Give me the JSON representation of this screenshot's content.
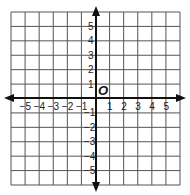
{
  "diagram": {
    "type": "coordinate-plane",
    "origin_label": "O",
    "x_range": [
      -6,
      6
    ],
    "y_range": [
      -6,
      6
    ],
    "x_tick_labels": [
      "−5",
      "−4",
      "−3",
      "−2",
      "−1",
      "1",
      "2",
      "3",
      "4",
      "5"
    ],
    "y_tick_labels": [
      "5",
      "4",
      "3",
      "2",
      "1",
      "−1",
      "−2",
      "−3",
      "−4",
      "−5"
    ],
    "grid_color": "#555555",
    "axis_color": "#111111"
  }
}
